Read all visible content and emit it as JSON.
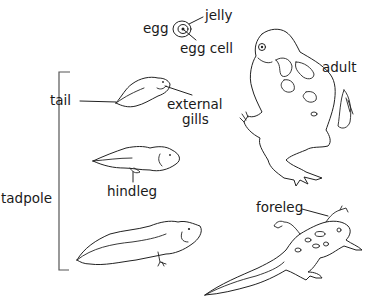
{
  "labels": {
    "egg": "egg",
    "jelly": "jelly",
    "egg_cell": "egg cell",
    "adult": "adult",
    "tail": "tail",
    "external_gills_line1": "external",
    "external_gills_line2": "gills",
    "tadpole": "tadpole",
    "hindleg": "hindleg",
    "foreleg": "foreleg"
  },
  "stages": [
    "egg",
    "tadpole with external gills",
    "tadpole with hindlegs",
    "tadpole with hindlegs (larger)",
    "froglet with forelegs",
    "adult"
  ],
  "colors": {
    "ink": "#1a1a1a",
    "background": "#ffffff",
    "bracket": "#555555"
  }
}
